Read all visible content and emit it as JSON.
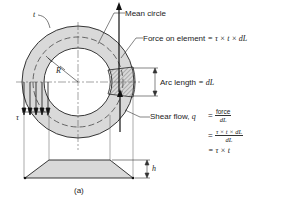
{
  "figure": {
    "caption": "(a)",
    "labels": {
      "t": "t",
      "R": "R",
      "tau": "τ",
      "h": "h",
      "mean_circle": "Mean circle",
      "force_on_element": "Force on element",
      "force_eq": "= τ × t × dL",
      "arc_length": "Arc length",
      "arc_eq": "= dL",
      "shear_flow": "Shear flow,",
      "q": "q",
      "eq1_equals": "=",
      "eq1_num": "force",
      "eq1_den": "dL",
      "eq2_equals": "=",
      "eq2_num": "τ × t × dL",
      "eq2_den": "dL",
      "eq3": "= τ × t"
    },
    "colors": {
      "ring_fill": "#d9d9d9",
      "line": "#222222",
      "hatch": "#555555"
    }
  }
}
